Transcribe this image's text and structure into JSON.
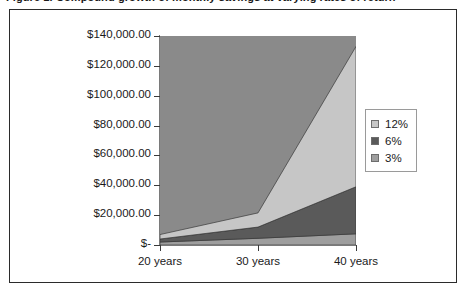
{
  "caption": {
    "text": "Figure 1. Compound growth of monthly savings at varying rates of return"
  },
  "chart_data": {
    "type": "area",
    "stacked": true,
    "title": "",
    "subtitle": "",
    "xlabel": "",
    "ylabel": "",
    "categories": [
      "20 years",
      "30 years",
      "40 years"
    ],
    "series": [
      {
        "name": "12%",
        "color": "#c6c6c6",
        "values": [
          3000,
          9500,
          94000
        ]
      },
      {
        "name": "6%",
        "color": "#5a5a5a",
        "values": [
          2000,
          7500,
          31500
        ]
      },
      {
        "name": "3%",
        "color": "#9e9e9e",
        "values": [
          2000,
          4500,
          7500
        ]
      }
    ],
    "cumulative_totals": [
      7000,
      21500,
      133000
    ],
    "ylim": [
      0,
      140000
    ],
    "ytick_values": [
      0,
      20000,
      40000,
      60000,
      80000,
      100000,
      120000,
      140000
    ],
    "ytick_labels": [
      "$-",
      "$20,000.00",
      "$40,000.00",
      "$60,000.00",
      "$80,000.00",
      "$100,000.00",
      "$120,000.00",
      "$140,000.00"
    ],
    "xtick_labels": [
      "20 years",
      "30 years",
      "40 years"
    ],
    "grid": false,
    "legend_position": "right",
    "legend_entries": [
      {
        "label": "12%",
        "color": "#c6c6c6"
      },
      {
        "label": "6%",
        "color": "#5a5a5a"
      },
      {
        "label": "3%",
        "color": "#9e9e9e"
      }
    ],
    "plot_area_background": "#8a8a8a",
    "chart_background": "#ffffff",
    "border_color": "#2b2b2b"
  }
}
